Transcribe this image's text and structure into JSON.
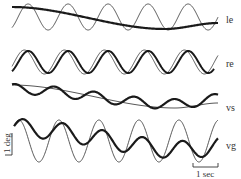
{
  "figure": {
    "colors": {
      "thin": "#444444",
      "thick": "#1a1a1a",
      "background": "#ffffff"
    }
  },
  "traces": [
    {
      "id": "le",
      "label": "le",
      "label_pos": [
        226,
        24
      ]
    },
    {
      "id": "re",
      "label": "re",
      "label_pos": [
        226,
        66
      ]
    },
    {
      "id": "vs",
      "label": "vs",
      "label_pos": [
        226,
        110
      ]
    },
    {
      "id": "vg",
      "label": "vg",
      "label_pos": [
        226,
        148
      ]
    }
  ],
  "scale_bars": {
    "amplitude": {
      "label": "1 deg"
    },
    "time": {
      "label": "1 sec"
    }
  },
  "chart_data": {
    "type": "line",
    "title": "",
    "xlabel": "time",
    "ylabel": "eye position (deg)",
    "grid": false,
    "legend": "none (inline labels at right end of each trace)",
    "panels": [
      {
        "name": "le",
        "series": [
          {
            "name": "stimulus (thin)",
            "shape": "sinusoid",
            "period_sec": 1.6,
            "amplitude_deg": 0.6,
            "cycles_shown": 5
          },
          {
            "name": "response (thick)",
            "shape": "slow drift",
            "start_offset_deg": 0.4,
            "min_offset_deg": -0.6,
            "end_offset_deg": -0.3
          }
        ]
      },
      {
        "name": "re",
        "series": [
          {
            "name": "stimulus (thin)",
            "shape": "sinusoid",
            "period_sec": 1.6,
            "amplitude_deg": 0.55,
            "cycles_shown": 5
          },
          {
            "name": "response (thick)",
            "shape": "sinusoid, slight phase lag",
            "period_sec": 1.6,
            "amplitude_deg": 0.5
          }
        ]
      },
      {
        "name": "vs",
        "series": [
          {
            "name": "stimulus (thin)",
            "shape": "slow drift",
            "start_offset_deg": 0.5,
            "min_offset_deg": -0.5,
            "end_offset_deg": -0.3
          },
          {
            "name": "response (thick)",
            "shape": "small oscillation on drift",
            "period_sec": 1.6,
            "amplitude_deg": 0.2
          }
        ]
      },
      {
        "name": "vg",
        "series": [
          {
            "name": "stimulus (thin)",
            "shape": "sinusoid",
            "period_sec": 1.6,
            "amplitude_deg": 0.9,
            "cycles_shown": 5
          },
          {
            "name": "response (thick)",
            "shape": "attenuated oscillation with downward drift",
            "period_sec": 1.6,
            "amplitude_deg": 0.4
          }
        ]
      }
    ],
    "scale": {
      "vertical": "1 deg",
      "horizontal": "1 sec"
    }
  }
}
